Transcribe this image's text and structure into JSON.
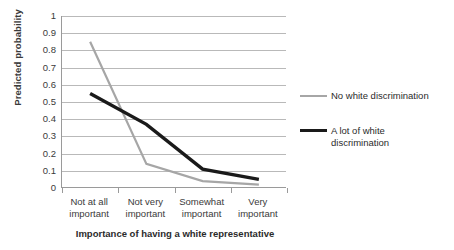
{
  "chart_data": {
    "type": "line",
    "title": "",
    "xlabel": "Importance of having a white representative",
    "ylabel": "Predicted probability",
    "categories": [
      "Not at all important",
      "Not very important",
      "Somewhat important",
      "Very important"
    ],
    "category_lines": [
      [
        "Not at all",
        "important"
      ],
      [
        "Not very",
        "important"
      ],
      [
        "Somewhat",
        "important"
      ],
      [
        "Very",
        "important"
      ]
    ],
    "ylim": [
      0,
      1
    ],
    "yticks": [
      "0",
      "0.1",
      "0.2",
      "0.3",
      "0.4",
      "0.5",
      "0.6",
      "0.7",
      "0.8",
      "0.9",
      "1"
    ],
    "ytick_values": [
      0,
      0.1,
      0.2,
      0.3,
      0.4,
      0.5,
      0.6,
      0.7,
      0.8,
      0.9,
      1
    ],
    "grid": true,
    "legend_position": "right",
    "series": [
      {
        "name": "No white discrimination",
        "name_lines": [
          "No white discrimination"
        ],
        "color": "#a6a6a6",
        "width": 2.2,
        "values": [
          0.85,
          0.14,
          0.04,
          0.02
        ]
      },
      {
        "name": "A lot of white discrimination",
        "name_lines": [
          "A lot of white",
          "discrimination"
        ],
        "color": "#1a1a1a",
        "width": 3.4,
        "values": [
          0.55,
          0.37,
          0.11,
          0.05
        ]
      }
    ]
  }
}
